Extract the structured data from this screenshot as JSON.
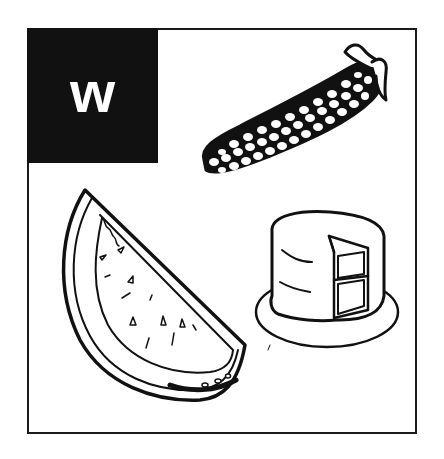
{
  "card": {
    "letter": "w",
    "colors": {
      "ink": "#111111",
      "paper": "#ffffff",
      "letter": "#ffffff"
    },
    "items": [
      {
        "name": "corn",
        "icon": "corn-icon"
      },
      {
        "name": "watermelon",
        "icon": "watermelon-slice-icon"
      },
      {
        "name": "cake",
        "icon": "layer-cake-icon"
      }
    ]
  }
}
